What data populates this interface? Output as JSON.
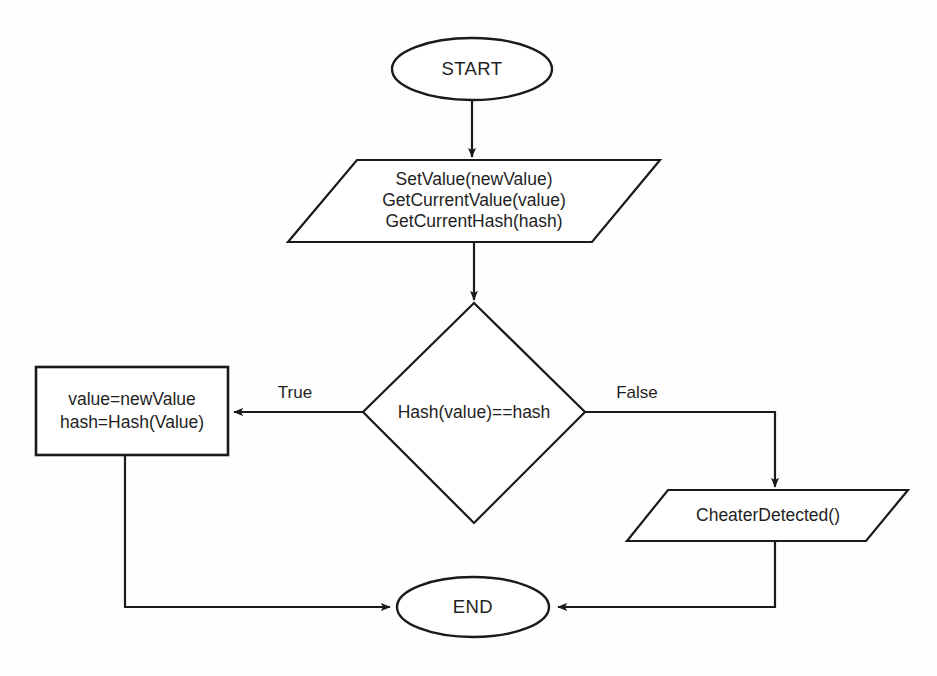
{
  "diagram": {
    "background_color": "#fefefe",
    "line_color": "#1a1a1a",
    "text_color": "#1f1f1f"
  },
  "nodes": {
    "start": {
      "label": "START",
      "shape": "ellipse"
    },
    "input_calls": {
      "line1": "SetValue(newValue)",
      "line2": "GetCurrentValue(value)",
      "line3": "GetCurrentHash(hash)",
      "shape": "parallelogram"
    },
    "decision": {
      "label": "Hash(value)==hash",
      "shape": "diamond"
    },
    "assign": {
      "line1": "value=newValue",
      "line2": "hash=Hash(Value)",
      "shape": "rectangle"
    },
    "cheater": {
      "label": "CheaterDetected()",
      "shape": "parallelogram"
    },
    "end": {
      "label": "END",
      "shape": "ellipse"
    }
  },
  "edges": {
    "true_label": "True",
    "false_label": "False"
  }
}
